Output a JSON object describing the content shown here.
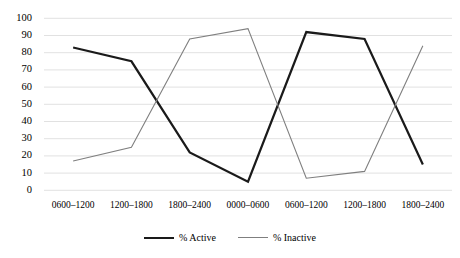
{
  "chart_data": {
    "type": "line",
    "title": "",
    "xlabel": "",
    "ylabel": "",
    "ylim": [
      0,
      100
    ],
    "ytick_step": 10,
    "grid": true,
    "legend_position": "bottom",
    "categories": [
      "0600–1200",
      "1200–1800",
      "1800–2400",
      "0000–0600",
      "0600–1200",
      "1200–1800",
      "1800–2400"
    ],
    "yticks": [
      "0",
      "10",
      "20",
      "30",
      "40",
      "50",
      "60",
      "70",
      "80",
      "90",
      "100"
    ],
    "series": [
      {
        "name": "% Active",
        "color": "#1a1a1a",
        "width": 2.2,
        "values": [
          83,
          75,
          22,
          5,
          92,
          88,
          15
        ]
      },
      {
        "name": "% Inactive",
        "color": "#7f7f7f",
        "width": 1.1,
        "values": [
          17,
          25,
          88,
          94,
          7,
          11,
          84
        ]
      }
    ]
  },
  "axis": {
    "grid_color": "#d9d9d9"
  }
}
